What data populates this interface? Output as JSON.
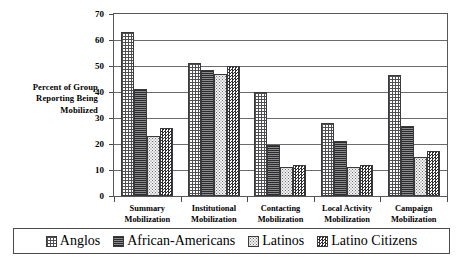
{
  "chart_data": {
    "type": "bar",
    "title": "",
    "xlabel": "",
    "ylabel": "Percent of Group Reporting Being Mobilized",
    "ylabel_lines": [
      "Percent of Group",
      "Reporting Being",
      "Mobilized"
    ],
    "ylim": [
      0,
      70
    ],
    "ytick_values": [
      0,
      10,
      20,
      30,
      40,
      50,
      60,
      70
    ],
    "ytick_labels": [
      "0",
      "10",
      "20",
      "30",
      "40",
      "50",
      "60",
      "70"
    ],
    "grid": true,
    "grid_axis": "y",
    "legend_position": "bottom",
    "categories": [
      "Summary Mobilization",
      "Institutional Mobilization",
      "Contacting Mobilization",
      "Local Activity Mobilization",
      "Campaign Mobilization"
    ],
    "category_lines": [
      [
        "Summary",
        "Mobilization"
      ],
      [
        "Institutional",
        "Mobilization"
      ],
      [
        "Contacting",
        "Mobilization"
      ],
      [
        "Local Activity",
        "Mobilization"
      ],
      [
        "Campaign",
        "Mobilization"
      ]
    ],
    "series": [
      {
        "name": "Anglos",
        "pattern": "grid-crosshatch",
        "values": [
          63,
          51,
          40,
          28,
          46.5
        ]
      },
      {
        "name": "African-Americans",
        "pattern": "dense-horizontal-lines",
        "values": [
          41,
          48.5,
          19.5,
          21,
          27
        ]
      },
      {
        "name": "Latinos",
        "pattern": "light-stipple",
        "values": [
          23,
          47,
          11,
          11,
          15
        ]
      },
      {
        "name": "Latino Citizens",
        "pattern": "dark-checkerboard",
        "values": [
          26,
          50,
          12,
          12,
          17.5
        ]
      }
    ]
  },
  "legend": {
    "items": [
      {
        "label": "Anglos",
        "pattern": "grid-crosshatch"
      },
      {
        "label": "African-Americans",
        "pattern": "dense-horizontal-lines"
      },
      {
        "label": "Latinos",
        "pattern": "light-stipple"
      },
      {
        "label": "Latino Citizens",
        "pattern": "dark-checkerboard"
      }
    ]
  }
}
